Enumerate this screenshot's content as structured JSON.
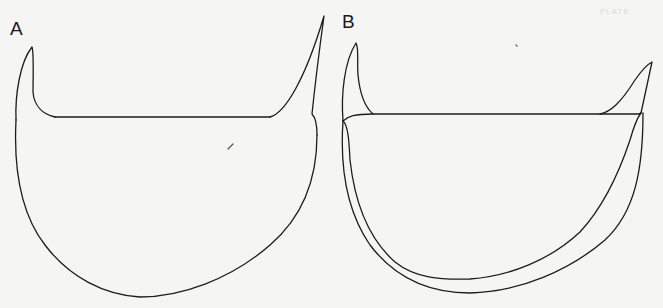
{
  "figure": {
    "type": "scientific line drawing",
    "panels": [
      {
        "label": "A",
        "description": "Outline drawing, single shell with pointed left horn and tall right spine"
      },
      {
        "label": "B",
        "description": "Outline drawing, double-walled shell with left and right horns"
      }
    ],
    "plate_mark": "PLATE"
  },
  "colors": {
    "background": "#f5f5f3",
    "line": "#1c1c1c"
  }
}
